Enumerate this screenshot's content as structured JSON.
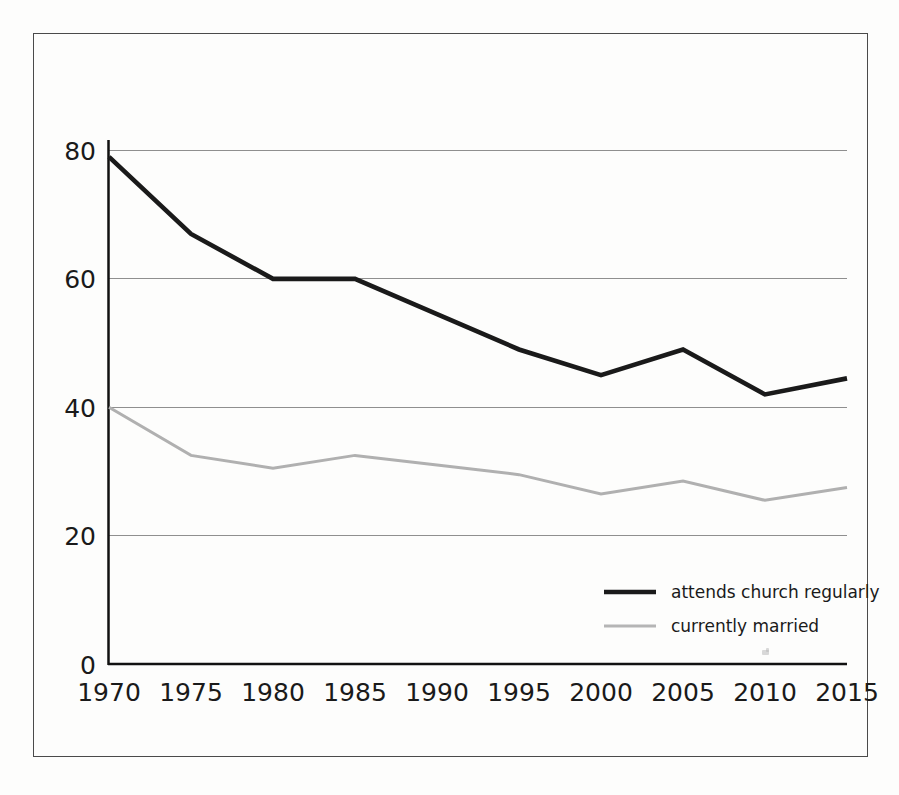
{
  "chart_data": {
    "type": "line",
    "title": "",
    "subtitle": "",
    "xlabel": "",
    "ylabel": "",
    "x": [
      1970,
      1975,
      1980,
      1985,
      1990,
      1995,
      2000,
      2005,
      2010,
      2015
    ],
    "categories": [
      "1970",
      "1975",
      "1980",
      "1985",
      "1990",
      "1995",
      "2000",
      "2005",
      "2010",
      "2015"
    ],
    "series": [
      {
        "name": "attends church regularly",
        "color": "#1a1a1a",
        "values": [
          79,
          67,
          60,
          60,
          54.5,
          49,
          45,
          49,
          42,
          44.5
        ]
      },
      {
        "name": "currently married",
        "color": "#b0b0b0",
        "values": [
          40,
          32.5,
          30.5,
          32.5,
          31,
          29.5,
          26.5,
          28.5,
          25.5,
          27.5
        ]
      }
    ],
    "xlim": [
      1970,
      2015
    ],
    "ylim": [
      0,
      80
    ],
    "y_ticks": [
      0,
      20,
      40,
      60,
      80
    ],
    "y_tick_labels": [
      "0",
      "20",
      "40",
      "60",
      "80"
    ],
    "x_ticks": [
      1970,
      1975,
      1980,
      1985,
      1990,
      1995,
      2000,
      2005,
      2010,
      2015
    ],
    "x_tick_labels": [
      "1970",
      "1975",
      "1980",
      "1985",
      "1990",
      "1995",
      "2000",
      "2005",
      "2010",
      "2015"
    ],
    "grid": true,
    "grid_axis": "y",
    "grid_color": "#8c8c8c",
    "legend_position": "inside lower right",
    "legend": [
      {
        "label": "attends church regularly",
        "color": "#1a1a1a",
        "width": 4.5
      },
      {
        "label": "currently married",
        "color": "#b5b5b5",
        "width": 3
      }
    ],
    "background_color": "#ffffff",
    "frame_color": "#4a4a4a",
    "axis_color": "#111111"
  },
  "axes": {
    "y_labels": [
      "80",
      "60",
      "40",
      "20",
      "0"
    ],
    "x_labels": [
      "1970",
      "1975",
      "1980",
      "1985",
      "1990",
      "1995",
      "2000",
      "2005",
      "2010",
      "2015"
    ]
  },
  "legend": {
    "items": [
      {
        "label": "attends church regularly"
      },
      {
        "label": "currently married"
      }
    ]
  }
}
